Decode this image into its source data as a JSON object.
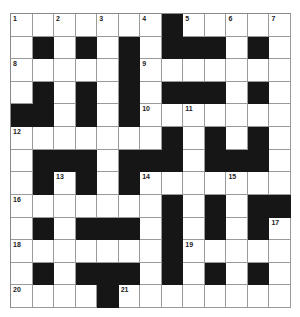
{
  "puzzle": {
    "rows": 13,
    "cols": 13,
    "layout": [
      "WWWWWWWBWWWWW",
      "WBWBWBWBBBWBW",
      "WWWWWBWWWWWWW",
      "WBWBWBWBBBWBW",
      "BBWBWBWWWWWWW",
      "WWWWWWWBWBWBW",
      "WBBBWBBBWBBBW",
      "WBWBWBWWWWWWW",
      "WWWWWWWBWBWBB",
      "WBWBBBWBWBWBW",
      "WWWWWWWBWWWWW",
      "WBWBBBWBWBWBW",
      "WWWWBWWWWWWWW"
    ],
    "numbers": [
      {
        "row": 0,
        "col": 0,
        "n": "1"
      },
      {
        "row": 0,
        "col": 2,
        "n": "2"
      },
      {
        "row": 0,
        "col": 4,
        "n": "3"
      },
      {
        "row": 0,
        "col": 6,
        "n": "4"
      },
      {
        "row": 0,
        "col": 8,
        "n": "5"
      },
      {
        "row": 0,
        "col": 10,
        "n": "6"
      },
      {
        "row": 0,
        "col": 12,
        "n": "7"
      },
      {
        "row": 2,
        "col": 0,
        "n": "8"
      },
      {
        "row": 2,
        "col": 6,
        "n": "9"
      },
      {
        "row": 4,
        "col": 6,
        "n": "10"
      },
      {
        "row": 4,
        "col": 8,
        "n": "11"
      },
      {
        "row": 5,
        "col": 0,
        "n": "12"
      },
      {
        "row": 7,
        "col": 2,
        "n": "13"
      },
      {
        "row": 7,
        "col": 6,
        "n": "14"
      },
      {
        "row": 7,
        "col": 10,
        "n": "15"
      },
      {
        "row": 8,
        "col": 0,
        "n": "16"
      },
      {
        "row": 9,
        "col": 12,
        "n": "17"
      },
      {
        "row": 10,
        "col": 0,
        "n": "18"
      },
      {
        "row": 10,
        "col": 8,
        "n": "19"
      },
      {
        "row": 12,
        "col": 0,
        "n": "20"
      },
      {
        "row": 12,
        "col": 5,
        "n": "21"
      }
    ],
    "colors": {
      "black": "#161616",
      "white": "#ffffff",
      "line": "#9a9a9a"
    }
  }
}
